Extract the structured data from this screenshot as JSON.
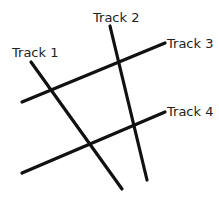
{
  "diagram": {
    "tracks": [
      {
        "name": "Track 1",
        "x1": 31,
        "y1": 62,
        "x2": 122,
        "y2": 189,
        "label_x": 12,
        "label_y": 57
      },
      {
        "name": "Track 2",
        "x1": 110,
        "y1": 26,
        "x2": 147,
        "y2": 180,
        "label_x": 93,
        "label_y": 22
      },
      {
        "name": "Track 3",
        "x1": 22,
        "y1": 102,
        "x2": 165,
        "y2": 43,
        "label_x": 167,
        "label_y": 48
      },
      {
        "name": "Track 4",
        "x1": 22,
        "y1": 173,
        "x2": 165,
        "y2": 112,
        "label_x": 167,
        "label_y": 116
      }
    ]
  }
}
